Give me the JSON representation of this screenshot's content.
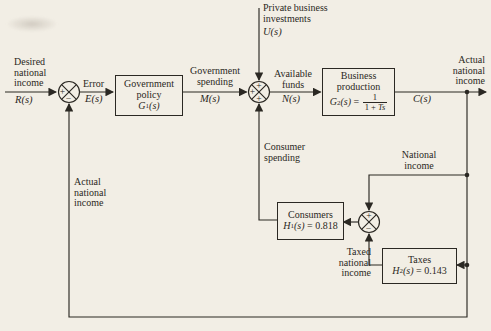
{
  "figure": {
    "bg": "#f2eee5",
    "ink": "#2b2823"
  },
  "signals": {
    "r": "R(s)",
    "e": "E(s)",
    "m": "M(s)",
    "n": "N(s)",
    "u": "U(s)",
    "c": "C(s)"
  },
  "labels": {
    "desired": [
      "Desired",
      "national",
      "income"
    ],
    "error": "Error",
    "gov_spending": [
      "Government",
      "spending"
    ],
    "private_investments": [
      "Private business",
      "investments"
    ],
    "available": [
      "Available",
      "funds"
    ],
    "actual_right": [
      "Actual",
      "national",
      "income"
    ],
    "national_income": [
      "National",
      "income"
    ],
    "consumer_spending": [
      "Consumer",
      "spending"
    ],
    "taxed": [
      "Taxed",
      "national",
      "income"
    ],
    "actual_left": [
      "Actual",
      "national",
      "income"
    ]
  },
  "blocks": {
    "gov_policy": {
      "line1": "Government",
      "line2": "policy",
      "sym": "G",
      "sub": "1",
      "arg": "(s)"
    },
    "business": {
      "line1": "Business",
      "line2": "production",
      "sym": "G",
      "sub": "2",
      "arg": "(s)",
      "eq": " = ",
      "num": "1",
      "den_pre": "1 + ",
      "den_var": "Ts"
    },
    "consumers": {
      "title": "Consumers",
      "sym": "H",
      "sub": "1",
      "arg": "(s)",
      "eq": " = 0.818"
    },
    "taxes": {
      "title": "Taxes",
      "sym": "H",
      "sub": "2",
      "arg": "(s)",
      "eq": " = 0.143"
    }
  },
  "junctions": {
    "j1": {
      "left": "+",
      "bottom": "−"
    },
    "j2": {
      "left": "+",
      "top": "+",
      "bottom": "+"
    },
    "j3": {
      "top": "+",
      "bottom": "−"
    }
  }
}
